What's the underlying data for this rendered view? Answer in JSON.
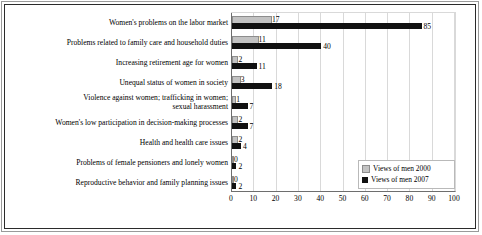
{
  "chart_data": {
    "type": "bar",
    "orientation": "horizontal",
    "title": "",
    "xlabel": "",
    "ylabel": "",
    "xlim": [
      0,
      100
    ],
    "xticks": [
      0,
      10,
      20,
      30,
      40,
      50,
      60,
      70,
      80,
      90,
      100
    ],
    "grid": true,
    "legend_position": "bottom-right",
    "categories": [
      "Women's problems on the labor market",
      "Problems related to  family care and household duties",
      "Increasing retirement age for women",
      "Unequal status of women in society",
      "Violence against women; trafficking in women;\nsexual harassment",
      "Women's low participation in  decision-making processes",
      "Health and health care issues",
      "Problems of female pensioners and lonely women",
      "Reproductive behavior and family planning issues"
    ],
    "series": [
      {
        "name": "Views of men 2000",
        "color": "#c3c3c3",
        "values": [
          17,
          11,
          2,
          3,
          1,
          2,
          2,
          0,
          0
        ]
      },
      {
        "name": "Views of men 2007",
        "color": "#111111",
        "values": [
          85,
          40,
          11,
          18,
          7,
          7,
          4,
          2,
          2
        ]
      }
    ]
  },
  "legend": {
    "entries": [
      {
        "label": "Views of men 2000",
        "swatch": "y2000"
      },
      {
        "label": "Views of men 2007",
        "swatch": "y2007"
      }
    ]
  }
}
